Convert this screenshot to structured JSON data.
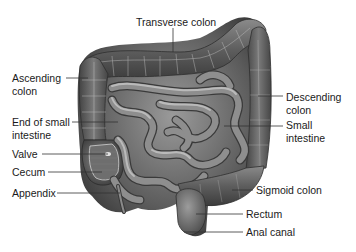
{
  "diagram": {
    "labels": {
      "transverse_colon": "Transverse colon",
      "ascending_colon_l1": "Ascending",
      "ascending_colon_l2": "colon",
      "end_small_intestine_l1": "End of small",
      "end_small_intestine_l2": "intestine",
      "valve": "Valve",
      "cecum": "Cecum",
      "appendix": "Appendix",
      "descending_colon_l1": "Descending",
      "descending_colon_l2": "colon",
      "small_intestine_l1": "Small",
      "small_intestine_l2": "intestine",
      "sigmoid_colon": "Sigmoid colon",
      "rectum": "Rectum",
      "anal_canal": "Anal canal"
    },
    "colors": {
      "background": "#ffffff",
      "text": "#1a1a1a",
      "leader_line": "#333333",
      "tissue_dark": "#3e3e3e",
      "tissue_mid": "#7a7a7a",
      "tissue_light": "#b8b8b8"
    }
  }
}
